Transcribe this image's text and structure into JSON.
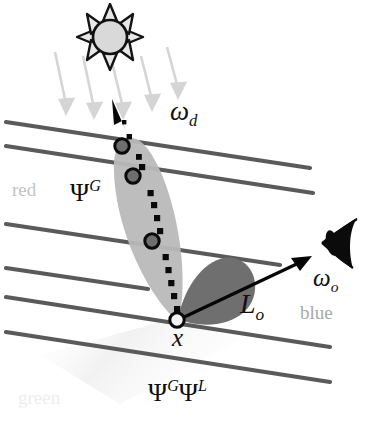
{
  "figure": {
    "background_color": "#ffffff"
  },
  "labels": {
    "omega_d": {
      "base": "ω",
      "sub": "d",
      "text": "ωd"
    },
    "omega_o": {
      "base": "ω",
      "sub": "o",
      "text": "ωo"
    },
    "radiance_out": {
      "base": "L",
      "sub": "o",
      "text": "Lo"
    },
    "point_x": {
      "text": "x"
    },
    "psi_global": {
      "base": "Ψ",
      "sup": "G",
      "text": "ΨG"
    },
    "psi_global_2": {
      "base": "Ψ",
      "sup": "G",
      "text": "ΨG"
    },
    "psi_local": {
      "base": "Ψ",
      "sup": "L",
      "text": "ΨL"
    },
    "band_red": {
      "text": "red",
      "color": "#c3c3c3"
    },
    "band_blue": {
      "text": "blue",
      "color": "#a9a9a9"
    },
    "band_green": {
      "text": "green",
      "color": "#eeeeee"
    }
  },
  "icons": {
    "sun": {
      "name": "sun-icon",
      "cx": 110,
      "cy": 37,
      "radius": 17,
      "fill": "#d9d9d9",
      "stroke": "#111111",
      "rays": 8
    },
    "eye": {
      "name": "eye-icon",
      "cx": 338,
      "cy": 243,
      "fill": "#0b0b0b"
    }
  },
  "colors": {
    "stripe_line": "#5a5a5a",
    "scatter_cone": "#b8b8b8",
    "phase_lobe": "#6f6f6f",
    "path_dots": "#0a0a0a",
    "node_fill": "#6e6e6e",
    "node_stroke": "#0a0a0a",
    "origin_fill": "#f2f2f2",
    "origin_stroke": "#0a0a0a",
    "sun_ray": "#d5d5d5",
    "arrow": "#050505",
    "faint_beam": "#f4f4f4"
  },
  "geometry": {
    "surface_lines": [
      {
        "x1": 6,
        "y1": 122,
        "x2": 310,
        "y2": 168
      },
      {
        "x1": 6,
        "y1": 145,
        "x2": 313,
        "y2": 193
      },
      {
        "x1": 6,
        "y1": 224,
        "x2": 280,
        "y2": 265
      },
      {
        "x1": 6,
        "y1": 268,
        "x2": 148,
        "y2": 289
      },
      {
        "x1": 6,
        "y1": 297,
        "x2": 330,
        "y2": 347
      },
      {
        "x1": 6,
        "y1": 332,
        "x2": 330,
        "y2": 382
      }
    ],
    "sun_rays": [
      {
        "x1": 55,
        "y1": 52,
        "x2": 68,
        "y2": 108
      },
      {
        "x1": 83,
        "y1": 56,
        "x2": 96,
        "y2": 112
      },
      {
        "x1": 112,
        "y1": 60,
        "x2": 125,
        "y2": 112
      },
      {
        "x1": 140,
        "y1": 54,
        "x2": 153,
        "y2": 104
      },
      {
        "x1": 166,
        "y1": 46,
        "x2": 179,
        "y2": 96
      }
    ],
    "scatter_path": {
      "start": {
        "x": 177,
        "y": 320
      },
      "end": {
        "x": 119,
        "y": 128
      },
      "dot_count": 17
    },
    "scatter_nodes": [
      {
        "x": 122,
        "y": 146,
        "r": 7
      },
      {
        "x": 133,
        "y": 176,
        "r": 7
      },
      {
        "x": 152,
        "y": 241,
        "r": 7
      }
    ],
    "origin_node": {
      "x": 177,
      "y": 320,
      "r": 7
    },
    "omega_d_arrow": {
      "x1": 130,
      "y1": 132,
      "x2": 114,
      "y2": 106
    },
    "omega_o_arrow": {
      "x1": 180,
      "y1": 319,
      "x2": 311,
      "y2": 257
    }
  }
}
